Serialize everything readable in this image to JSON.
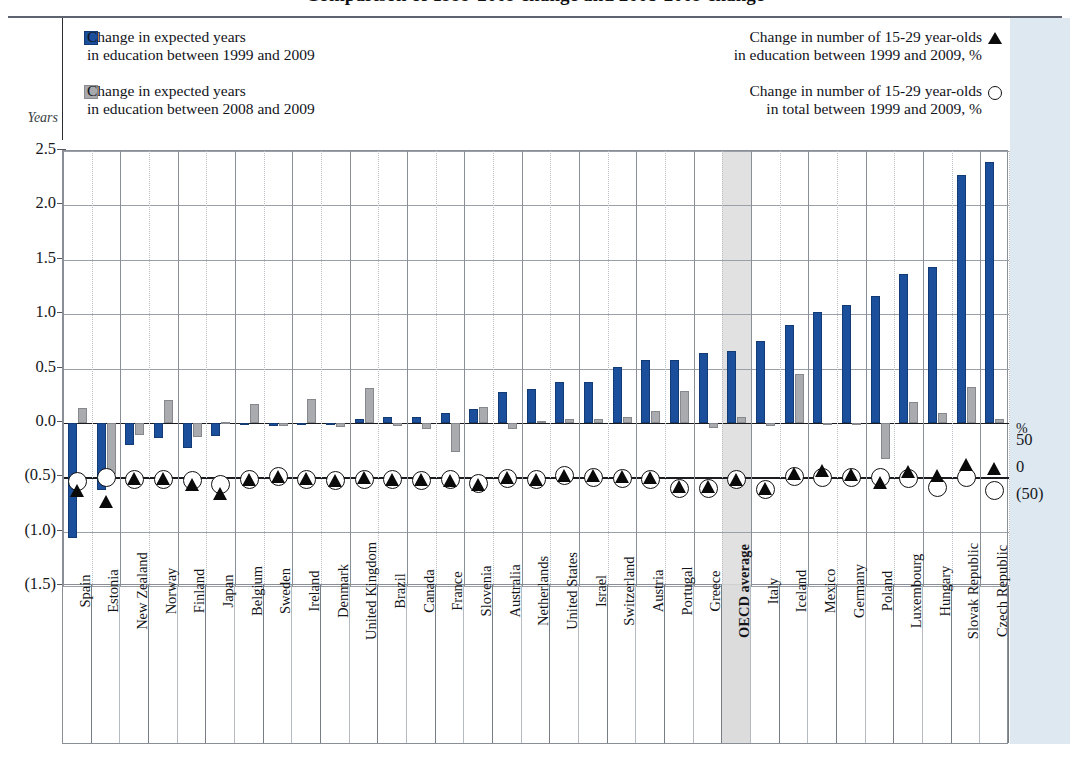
{
  "title": "Comparison of 1999-2009 change and 2008-2009 change",
  "axes": {
    "y_label": "Years",
    "y_ticks": [
      "2.5",
      "2.0",
      "1.5",
      "1.0",
      "0.5",
      "0.0",
      "(0.5)",
      "(1.0)",
      "(1.5)"
    ],
    "right_unit": "%",
    "right_ticks": [
      "50",
      "0",
      "(50)"
    ]
  },
  "legend": {
    "blue_line1": "Change in expected years",
    "blue_line2": "in education between 1999 and 2009",
    "grey_line1": "Change in expected years",
    "grey_line2": "in education between 2008 and 2009",
    "tri_line1": "Change in number of 15-29 year-olds",
    "tri_line2": "in education between 1999 and 2009, %",
    "cir_line1": "Change in number of 15-29 year-olds",
    "cir_line2": "in total between 1999 and 2009, %",
    "blue_color": "#1b4f9c",
    "grey_color": "#a9abae",
    "marker_color": "#0a0a0a"
  },
  "chart_data": {
    "type": "bar",
    "title": "Comparison of 1999-2009 change and 2008-2009 change",
    "xlabel": "",
    "ylabel": "Years",
    "ylim": [
      -1.5,
      2.5
    ],
    "y2label": "%",
    "y2lim": [
      -50,
      50
    ],
    "grid": true,
    "legend_position": "top",
    "categories": [
      "Spain",
      "Estonia",
      "New Zealand",
      "Norway",
      "Finland",
      "Japan",
      "Belgium",
      "Sweden",
      "Ireland",
      "Denmark",
      "United Kingdom",
      "Brazil",
      "Canada",
      "France",
      "Slovenia",
      "Australia",
      "Netherlands",
      "United States",
      "Israel",
      "Switzerland",
      "Austria",
      "Portugal",
      "Greece",
      "OECD average",
      "Italy",
      "Iceland",
      "Mexico",
      "Germany",
      "Poland",
      "Luxembourg",
      "Hungary",
      "Slovak Republic",
      "Czech Republic"
    ],
    "highlight_category": "OECD average",
    "series": [
      {
        "name": "Change in expected years in education between 1999 and 2009",
        "type": "bar",
        "axis": "left",
        "color": "#1b4f9c",
        "values": [
          -1.06,
          -0.62,
          -0.2,
          -0.14,
          -0.23,
          -0.12,
          -0.02,
          -0.03,
          -0.01,
          -0.01,
          0.04,
          0.05,
          0.05,
          0.09,
          0.13,
          0.28,
          0.31,
          0.38,
          0.38,
          0.51,
          0.58,
          0.58,
          0.64,
          0.66,
          0.75,
          0.9,
          1.02,
          1.08,
          1.17,
          1.37,
          1.43,
          2.28,
          2.4
        ]
      },
      {
        "name": "Change in expected years in education between 2008 and 2009",
        "type": "bar",
        "axis": "left",
        "color": "#a9abae",
        "values": [
          0.14,
          -0.47,
          -0.11,
          0.21,
          -0.13,
          0.01,
          0.17,
          -0.03,
          0.22,
          -0.04,
          0.32,
          -0.03,
          -0.06,
          -0.27,
          0.15,
          -0.06,
          0.02,
          0.04,
          0.04,
          0.05,
          0.11,
          0.29,
          -0.05,
          0.05,
          -0.03,
          0.45,
          -0.02,
          -0.01,
          -0.33,
          0.19,
          0.09,
          0.33,
          0.04
        ]
      },
      {
        "name": "Change in number of 15-29 year-olds in education between 1999 and 2009, %",
        "type": "scatter",
        "axis": "right",
        "marker": "triangle",
        "values": [
          -25,
          -44,
          -2,
          -3,
          -13,
          -30,
          -5,
          1,
          -2,
          -6,
          -1,
          -4,
          -5,
          -6,
          -13,
          -1,
          -5,
          3,
          4,
          1,
          -1,
          -17,
          -17,
          -4,
          -21,
          6,
          13,
          5,
          -10,
          10,
          4,
          24,
          16
        ]
      },
      {
        "name": "Change in number of 15-29 year-olds in total between 1999 and 2009, %",
        "type": "scatter",
        "axis": "right",
        "marker": "circle",
        "values": [
          -8,
          0,
          -4,
          -4,
          -6,
          -13,
          -4,
          2,
          -4,
          -6,
          -4,
          -5,
          -6,
          -4,
          -11,
          -3,
          -4,
          3,
          -1,
          -3,
          -4,
          -20,
          -21,
          -4,
          -22,
          2,
          -1,
          -1,
          -1,
          -2,
          -18,
          -1,
          -24
        ]
      }
    ]
  }
}
